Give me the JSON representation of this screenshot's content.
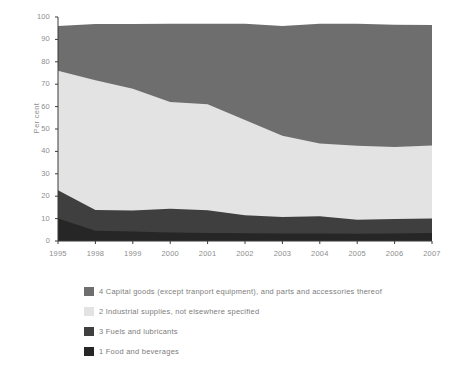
{
  "chart_data": {
    "type": "area",
    "stacked": true,
    "title": "",
    "xlabel": "",
    "ylabel": "Per cent",
    "ylim": [
      0,
      100
    ],
    "yticks": [
      0,
      10,
      20,
      30,
      40,
      50,
      60,
      70,
      80,
      90,
      100
    ],
    "grid": false,
    "legend_position": "below",
    "x": [
      "1995",
      "1998",
      "1999",
      "2000",
      "2001",
      "2002",
      "2003",
      "2004",
      "2005",
      "2006",
      "2007"
    ],
    "categories": [
      "1995",
      "1998",
      "1999",
      "2000",
      "2001",
      "2002",
      "2003",
      "2004",
      "2005",
      "2006",
      "2007"
    ],
    "series": [
      {
        "name": "1 Food and beverages",
        "color": "#262626",
        "values": [
          10.0,
          4.6,
          4.2,
          3.8,
          3.6,
          3.5,
          3.4,
          3.3,
          3.2,
          3.4,
          3.6
        ]
      },
      {
        "name": "3 Fuels and lubricants",
        "color": "#3f3f3f",
        "values": [
          12.7,
          9.2,
          9.4,
          10.6,
          10.1,
          8.0,
          7.3,
          7.8,
          6.3,
          6.4,
          6.4
        ]
      },
      {
        "name": "2 Industrial supplies, not elsewhere specified",
        "color": "#e3e3e3",
        "values": [
          53.3,
          58.0,
          54.4,
          47.6,
          47.3,
          42.5,
          36.3,
          32.4,
          33.0,
          32.2,
          32.6
        ]
      },
      {
        "name": "4 Capital goods (except tranport equipment), and parts and accessories thereof",
        "color": "#6e6e6e",
        "values": [
          20.0,
          25.1,
          28.9,
          35.0,
          36.0,
          43.0,
          49.0,
          53.5,
          54.5,
          54.5,
          53.8
        ]
      }
    ],
    "cumulative_tops": {
      "food": [
        10.0,
        4.6,
        4.2,
        3.8,
        3.6,
        3.5,
        3.4,
        3.3,
        3.2,
        3.4,
        3.6
      ],
      "fuels": [
        22.7,
        13.8,
        13.6,
        14.4,
        13.7,
        11.5,
        10.7,
        11.1,
        9.5,
        9.8,
        10.0
      ],
      "industrial": [
        76.0,
        71.8,
        68.0,
        62.0,
        61.0,
        54.0,
        47.0,
        43.5,
        42.5,
        42.0,
        42.6
      ],
      "capital": [
        96.0,
        96.9,
        96.9,
        97.0,
        97.0,
        97.0,
        96.0,
        97.0,
        97.0,
        96.5,
        96.4
      ]
    }
  },
  "legend": {
    "items": [
      {
        "label": "4 Capital goods (except tranport equipment), and parts and accessories thereof",
        "color": "#6e6e6e",
        "swatch_name": "legend-swatch-capital-goods"
      },
      {
        "label": "2 Industrial supplies, not elsewhere specified",
        "color": "#e3e3e3",
        "swatch_name": "legend-swatch-industrial-supplies"
      },
      {
        "label": "3 Fuels and lubricants",
        "color": "#3f3f3f",
        "swatch_name": "legend-swatch-fuels-lubricants"
      },
      {
        "label": "1 Food and beverages",
        "color": "#262626",
        "swatch_name": "legend-swatch-food-beverages"
      }
    ]
  },
  "axes": {
    "y_title": "Per cent",
    "y_tick_labels": [
      "100",
      "90",
      "80",
      "70",
      "60",
      "50",
      "40",
      "30",
      "20",
      "10",
      "0"
    ],
    "x_tick_labels": [
      "1995",
      "1998",
      "1999",
      "2000",
      "2001",
      "2002",
      "2003",
      "2004",
      "2005",
      "2006",
      "2007"
    ]
  },
  "colors": {
    "axis": "#3a3a3a",
    "tick_text": "#8d8d8d",
    "background": "#ffffff"
  }
}
